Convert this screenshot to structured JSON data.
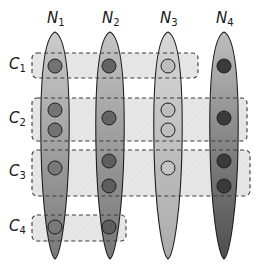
{
  "diagram": {
    "columns": [
      {
        "id": "N1",
        "label": "N",
        "sub": "1",
        "cx": 55,
        "fill_top": "#c8c8c8",
        "fill_bottom": "#6e6e6e"
      },
      {
        "id": "N2",
        "label": "N",
        "sub": "2",
        "cx": 110,
        "fill_top": "#c0c0c0",
        "fill_bottom": "#6a6a6a"
      },
      {
        "id": "N3",
        "label": "N",
        "sub": "3",
        "cx": 168,
        "fill_top": "#d4d4d4",
        "fill_bottom": "#a4a4a4"
      },
      {
        "id": "N4",
        "label": "N",
        "sub": "4",
        "cx": 224,
        "fill_top": "#b8b8b8",
        "fill_bottom": "#3e3e3e"
      }
    ],
    "rows": [
      {
        "id": "C1",
        "label": "C",
        "sub": "1",
        "x": 32,
        "y": 53,
        "w": 166,
        "h": 25
      },
      {
        "id": "C2",
        "label": "C",
        "sub": "2",
        "x": 32,
        "y": 98,
        "w": 215,
        "h": 43
      },
      {
        "id": "C3",
        "label": "C",
        "sub": "3",
        "x": 32,
        "y": 150,
        "w": 218,
        "h": 46
      },
      {
        "id": "C4",
        "label": "C",
        "sub": "4",
        "x": 32,
        "y": 215,
        "w": 94,
        "h": 26
      }
    ],
    "nodes": [
      {
        "col": "N1",
        "row": "C1",
        "cx": 55,
        "cy": 66,
        "fill": "#737373"
      },
      {
        "col": "N1",
        "row": "C2",
        "cx": 55,
        "cy": 110,
        "fill": "#737373"
      },
      {
        "col": "N1",
        "row": "C2",
        "cx": 55,
        "cy": 130,
        "fill": "#737373"
      },
      {
        "col": "N1",
        "row": "C3",
        "cx": 55,
        "cy": 168,
        "fill": "#787878"
      },
      {
        "col": "N1",
        "row": "C4",
        "cx": 55,
        "cy": 227,
        "fill": "#787878"
      },
      {
        "col": "N2",
        "row": "C1",
        "cx": 109,
        "cy": 66,
        "fill": "#646464"
      },
      {
        "col": "N2",
        "row": "C2",
        "cx": 109,
        "cy": 118,
        "fill": "#646464"
      },
      {
        "col": "N2",
        "row": "C3",
        "cx": 109,
        "cy": 161,
        "fill": "#5e5e5e"
      },
      {
        "col": "N2",
        "row": "C3",
        "cx": 109,
        "cy": 186,
        "fill": "#5e5e5e"
      },
      {
        "col": "N2",
        "row": "C4",
        "cx": 109,
        "cy": 227,
        "fill": "#5e5e5e"
      },
      {
        "col": "N3",
        "row": "C1",
        "cx": 168,
        "cy": 66,
        "fill": "#bdbdbd"
      },
      {
        "col": "N3",
        "row": "C2",
        "cx": 168,
        "cy": 110,
        "fill": "#bdbdbd"
      },
      {
        "col": "N3",
        "row": "C2",
        "cx": 168,
        "cy": 130,
        "fill": "#bdbdbd"
      },
      {
        "col": "N3",
        "row": "C3",
        "cx": 168,
        "cy": 168,
        "fill": "#c4c4c4"
      },
      {
        "col": "N4",
        "row": "C1",
        "cx": 224,
        "cy": 66,
        "fill": "#3a3a3a"
      },
      {
        "col": "N4",
        "row": "C2",
        "cx": 224,
        "cy": 118,
        "fill": "#3a3a3a"
      },
      {
        "col": "N4",
        "row": "C3",
        "cx": 224,
        "cy": 161,
        "fill": "#3a3a3a"
      },
      {
        "col": "N4",
        "row": "C3",
        "cx": 224,
        "cy": 186,
        "fill": "#3a3a3a"
      }
    ],
    "colors": {
      "rect_fill": "#e4e4e4",
      "rect_stroke": "#3a3a3a",
      "ellipse_stroke": "#1e1e1e",
      "node_stroke": "#1e1e1e"
    }
  }
}
